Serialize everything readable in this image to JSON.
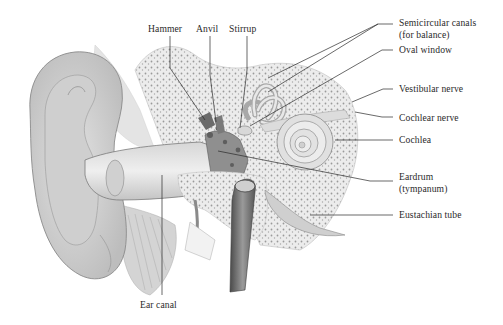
{
  "diagram": {
    "labels": {
      "hammer": "Hammer",
      "anvil": "Anvil",
      "stirrup": "Stirrup",
      "semicircular_canals_line1": "Semicircular canals",
      "semicircular_canals_line2": "(for balance)",
      "oval_window": "Oval window",
      "vestibular_nerve": "Vestibular nerve",
      "cochlear_nerve": "Cochlear nerve",
      "cochlea": "Cochlea",
      "eardrum_line1": "Eardrum",
      "eardrum_line2": "(tympanum)",
      "eustachian_tube": "Eustachian tube",
      "ear_canal": "Ear canal"
    },
    "colors": {
      "background": "#ffffff",
      "ink": "#2a2a2a",
      "tissue_light": "#e6e6e6",
      "tissue_mid": "#c8c8c8",
      "tissue_dark": "#6e6e6e"
    }
  }
}
